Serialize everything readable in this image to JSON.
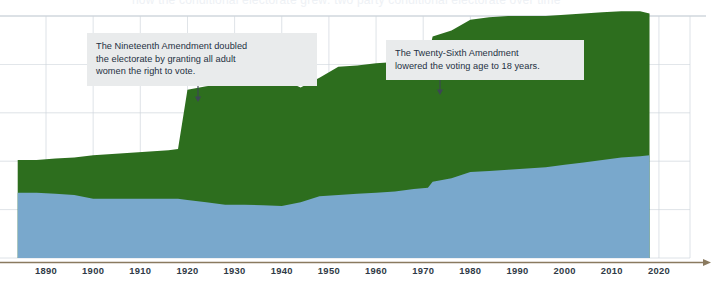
{
  "page": {
    "clipped_headline": "how the conditional electorate grew: two party conditional electorate over time"
  },
  "annotations": [
    {
      "id": "nineteenth-amendment",
      "text": "The Nineteenth Amendment doubled\nthe electorate by granting all adult\nwomen the right to vote.",
      "pointer_year": 1920,
      "pointer_x": 198,
      "pointer_y_top": 80,
      "pointer_y_bottom": 102
    },
    {
      "id": "twenty-sixth-amendment",
      "text": "The Twenty-Sixth Amendment\nlowered the voting age to 18 years.",
      "pointer_year": 1971,
      "pointer_x": 440,
      "pointer_y_top": 72,
      "pointer_y_bottom": 95
    }
  ],
  "colors": {
    "green": "#2d6e1e",
    "blue": "#79a8cc",
    "grid": "#cfd6dd",
    "axis_line": "#8a7a5f",
    "annotation_bg": "#e9ebec",
    "annotation_text": "#243042",
    "tick_text": "#2f3a46",
    "top_rule": "#b9c3cc"
  },
  "chart_data": {
    "type": "area",
    "title": "",
    "subtitle": "",
    "xlabel": "",
    "ylabel": "",
    "stacked": true,
    "grid": true,
    "legend_position": "none",
    "xlim": [
      1884,
      2020
    ],
    "ylim": [
      0,
      100
    ],
    "x_ticks": [
      1890,
      1900,
      1910,
      1920,
      1930,
      1940,
      1950,
      1960,
      1970,
      1980,
      1990,
      2000,
      2010,
      2020
    ],
    "y_gridlines": [
      0,
      20,
      40,
      60,
      80,
      100
    ],
    "x": [
      1884,
      1888,
      1892,
      1896,
      1900,
      1904,
      1908,
      1912,
      1916,
      1918,
      1920,
      1924,
      1928,
      1932,
      1936,
      1940,
      1944,
      1948,
      1952,
      1956,
      1960,
      1964,
      1968,
      1971,
      1972,
      1976,
      1980,
      1984,
      1988,
      1992,
      1996,
      2000,
      2004,
      2008,
      2012,
      2016,
      2018
    ],
    "series": [
      {
        "name": "lower-band",
        "color": "#79a8cc",
        "values": [
          27.0,
          27.0,
          26.6,
          26.0,
          24.5,
          24.5,
          24.5,
          24.5,
          24.5,
          24.5,
          24.0,
          23.0,
          22.0,
          22.0,
          21.8,
          21.5,
          23.0,
          25.5,
          26.0,
          26.5,
          27.0,
          27.5,
          28.5,
          29.0,
          31.5,
          33.0,
          35.5,
          36.0,
          36.5,
          37.0,
          37.5,
          38.5,
          39.5,
          40.5,
          41.5,
          42.0,
          42.5
        ]
      },
      {
        "name": "upper-band",
        "color": "#2d6e1e",
        "values": [
          13.5,
          13.5,
          14.5,
          15.5,
          18.0,
          18.5,
          19.0,
          19.5,
          20.0,
          20.5,
          45.5,
          48.0,
          50.0,
          51.0,
          52.0,
          52.5,
          47.5,
          49.0,
          53.0,
          53.0,
          53.5,
          53.5,
          54.0,
          54.0,
          60.0,
          61.0,
          63.0,
          63.5,
          63.5,
          63.0,
          62.5,
          62.0,
          61.5,
          61.0,
          60.5,
          60.0,
          58.5
        ]
      }
    ]
  },
  "axis": {
    "tick_labels": [
      "1890",
      "1900",
      "1910",
      "1920",
      "1930",
      "1940",
      "1950",
      "1960",
      "1970",
      "1980",
      "1990",
      "2000",
      "2010",
      "2020"
    ],
    "has_arrow_head": true
  }
}
